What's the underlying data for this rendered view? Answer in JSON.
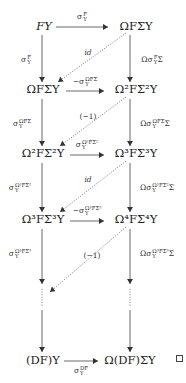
{
  "diagram": {
    "type": "commutative-diagram",
    "nodes": {
      "r1_left": "FY",
      "r1_right": "ΩFΣY",
      "r2_left": "ΩFΣY",
      "r2_right": "Ω²FΣ²Y",
      "r3_left": "Ω²FΣ²Y",
      "r3_right": "Ω³FΣ³Y",
      "r4_left": "Ω³FΣ³Y",
      "r4_right": "Ω⁴FΣ⁴Y",
      "r5_left": "⋮",
      "r5_right": "⋮",
      "r6_left": "(DF)Y",
      "r6_right": "Ω(DF)ΣY"
    },
    "horizontal_labels": {
      "h1": "σ_Y^F",
      "h2": "−σ_Y^{ΩFΣ}",
      "h3": "σ_Y^{Ω²FΣ²}",
      "h4": "−σ_Y^{Ω³FΣ³}",
      "h6": "σ_Y^{DF}"
    },
    "left_vertical_labels": {
      "v1": "σ_Y^F",
      "v2": "σ_Y^{ΩFΣ}",
      "v3": "σ_Y^{Ω²FΣ²}",
      "v4": "σ_Y^{Ω³FΣ³}"
    },
    "right_vertical_labels": {
      "v1": "Ωσ_Y^FΣ",
      "v2": "Ωσ_Y^{ΩFΣ}Σ",
      "v3": "Ωσ_Y^{Ω²FΣ²}Σ",
      "v4": "Ωσ_Y^{Ω³FΣ³}Σ"
    },
    "diagonal_labels": {
      "d1": "id",
      "d2": "(−1)",
      "d3": "id",
      "d4": "(−1)"
    },
    "end_mark": "□"
  }
}
